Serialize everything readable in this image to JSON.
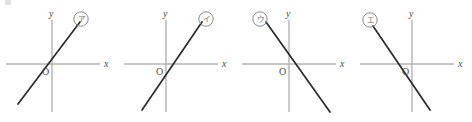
{
  "figure": {
    "name": "four-linear-graph-choices",
    "axis_color": "#b3b3b3",
    "line_color": "#2b2b2b",
    "label_color": "#6e6e6e",
    "panel_count": 4
  },
  "panels": [
    {
      "id": "panel-a",
      "marker": "ア",
      "marker_position": "upper-right",
      "x_axis_label": "x",
      "y_axis_label": "y",
      "origin_label": "O",
      "slope_sign": "positive",
      "intercept_sign": "positive",
      "x_intercept_side": "left-of-origin"
    },
    {
      "id": "panel-b",
      "marker": "イ",
      "marker_position": "upper-right",
      "x_axis_label": "x",
      "y_axis_label": "y",
      "origin_label": "O",
      "slope_sign": "positive",
      "intercept_sign": "negative",
      "x_intercept_side": "right-of-origin"
    },
    {
      "id": "panel-c",
      "marker": "ウ",
      "marker_position": "upper-left",
      "x_axis_label": "x",
      "y_axis_label": "y",
      "origin_label": "O",
      "slope_sign": "negative",
      "intercept_sign": "positive",
      "x_intercept_side": "right-of-origin"
    },
    {
      "id": "panel-d",
      "marker": "エ",
      "marker_position": "upper-left",
      "x_axis_label": "x",
      "y_axis_label": "y",
      "origin_label": "O",
      "slope_sign": "negative",
      "intercept_sign": "negative",
      "x_intercept_side": "left-of-origin"
    }
  ]
}
